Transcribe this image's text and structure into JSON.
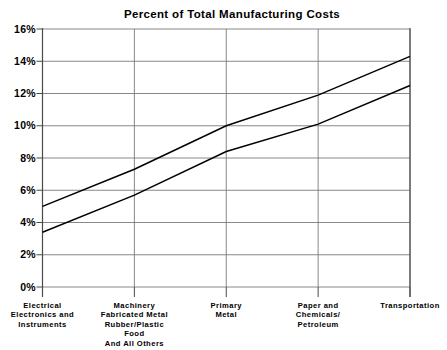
{
  "chart_data": {
    "type": "line",
    "title": "Percent of Total Manufacturing Costs",
    "xlabel": "",
    "ylabel": "",
    "categories": [
      "Electrical\nElectronics and\nInstruments",
      "Machinery\nFabricated Metal\nRubber/Plastic\nFood\nAnd All Others",
      "Primary\nMetal",
      "Paper and\nChemicals/\nPetroleum",
      "Transportation"
    ],
    "x": [
      0,
      1,
      2,
      3,
      4
    ],
    "series": [
      {
        "name": "upper",
        "values": [
          5.0,
          7.3,
          10.0,
          11.9,
          14.3
        ]
      },
      {
        "name": "lower",
        "values": [
          3.4,
          5.7,
          8.4,
          10.1,
          12.5
        ]
      }
    ],
    "ylim": [
      0,
      16
    ],
    "yticks": [
      0,
      2,
      4,
      6,
      8,
      10,
      12,
      14,
      16
    ],
    "ytick_labels": [
      "0%",
      "2%",
      "4%",
      "6%",
      "8%",
      "10%",
      "12%",
      "14%",
      "16%"
    ],
    "grid": true,
    "grid_x": true,
    "grid_y": true,
    "legend": "none",
    "line_color": "#000000",
    "grid_color": "#7a7a7a",
    "axis_color": "#4a4a4a",
    "background": "#ffffff"
  }
}
